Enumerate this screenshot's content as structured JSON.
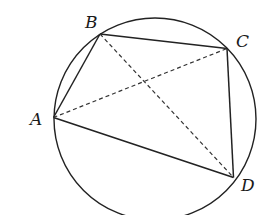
{
  "diagram": {
    "type": "cyclic-quadrilateral",
    "colors": {
      "stroke": "#222222",
      "background": "#ffffff"
    },
    "circle": {
      "cx": 155,
      "cy": 119,
      "r": 101
    },
    "points": {
      "A": {
        "label": "A",
        "x": 53.5,
        "y": 117.5,
        "label_x": 36,
        "label_y": 125
      },
      "B": {
        "label": "B",
        "x": 100,
        "y": 34,
        "label_x": 91,
        "label_y": 28
      },
      "C": {
        "label": "C",
        "x": 227,
        "y": 48.5,
        "label_x": 242,
        "label_y": 47
      },
      "D": {
        "label": "D",
        "x": 233.5,
        "y": 177.5,
        "label_x": 248,
        "label_y": 191
      }
    },
    "sides": [
      {
        "name": "AB",
        "from": "A",
        "to": "B",
        "style": "solid"
      },
      {
        "name": "BC",
        "from": "B",
        "to": "C",
        "style": "solid"
      },
      {
        "name": "CD",
        "from": "C",
        "to": "D",
        "style": "solid"
      },
      {
        "name": "DA",
        "from": "D",
        "to": "A",
        "style": "solid"
      }
    ],
    "diagonals": [
      {
        "name": "AC",
        "from": "A",
        "to": "C",
        "style": "dashed"
      },
      {
        "name": "BD",
        "from": "B",
        "to": "D",
        "style": "dashed"
      }
    ]
  }
}
